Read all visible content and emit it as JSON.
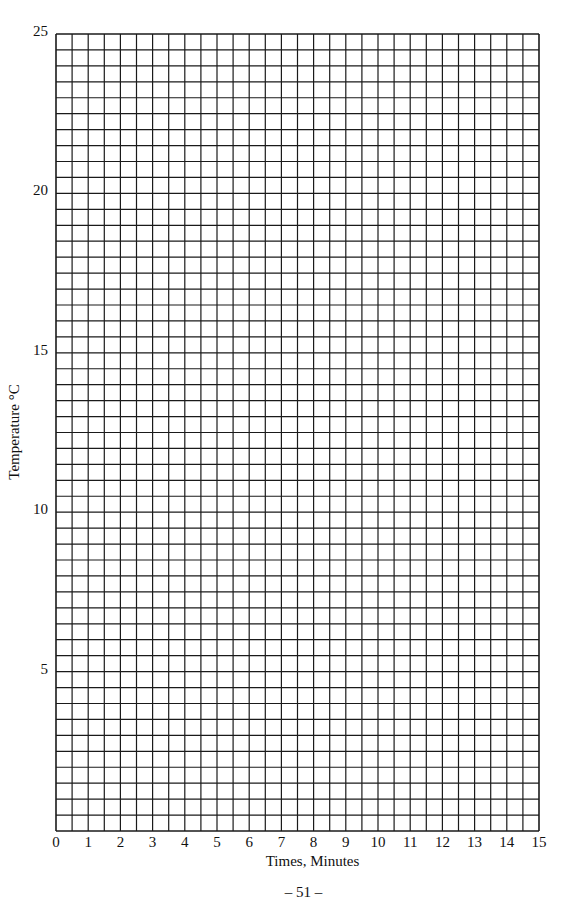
{
  "chart_data": {
    "type": "line",
    "title": "",
    "xlabel": "Times, Minutes",
    "ylabel": "Temperature °C",
    "xlim": [
      0,
      15
    ],
    "ylim": [
      0,
      25
    ],
    "x_ticks": [
      "0",
      "1",
      "2",
      "3",
      "4",
      "5",
      "6",
      "7",
      "8",
      "9",
      "10",
      "11",
      "12",
      "13",
      "14",
      "15"
    ],
    "y_ticks": [
      "5",
      "10",
      "15",
      "20",
      "25"
    ],
    "grid": true,
    "grid_x_step": 0.5,
    "grid_y_step": 0.5,
    "series": [],
    "note": "Blank graph paper grid for plotting temperature vs time"
  },
  "page": {
    "number_label": "–  51  –"
  },
  "style": {
    "grid_color": "#1a1a1a",
    "background": "#ffffff"
  }
}
